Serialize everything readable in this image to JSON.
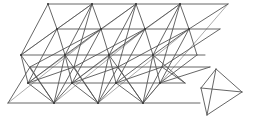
{
  "diagram": {
    "title": "",
    "stroke_color": "#555555",
    "light_stroke_color": "#888888",
    "background": "#ffffff",
    "lattice": {
      "rows": {
        "r0": {
          "y": 4,
          "xs": [
            48,
            92,
            136,
            180
          ]
        },
        "r1": {
          "y": 29,
          "xs": [
            57,
            101,
            145,
            189
          ]
        },
        "r2": {
          "y": 55,
          "xs": [
            21,
            65,
            109,
            153
          ]
        },
        "r3": {
          "y": 67,
          "xs": [
            30,
            74,
            118,
            162
          ]
        },
        "r4": {
          "y": 83,
          "xs": [
            28,
            72,
            116,
            160
          ]
        },
        "r5": {
          "y": 103,
          "xs": [
            54,
            98,
            143
          ]
        }
      },
      "lines": [
        [
          48,
          4,
          228,
          4
        ],
        [
          57,
          29,
          220,
          29
        ],
        [
          21,
          55,
          205,
          55
        ],
        [
          30,
          67,
          210,
          67
        ],
        [
          28,
          83,
          185,
          83
        ],
        [
          8,
          103,
          200,
          103
        ],
        [
          48,
          4,
          57,
          29
        ],
        [
          92,
          4,
          101,
          29
        ],
        [
          136,
          4,
          145,
          29
        ],
        [
          180,
          4,
          189,
          29
        ],
        [
          48,
          4,
          21,
          55
        ],
        [
          92,
          4,
          65,
          55
        ],
        [
          136,
          4,
          109,
          55
        ],
        [
          180,
          4,
          153,
          55
        ],
        [
          92,
          4,
          57,
          29
        ],
        [
          136,
          4,
          101,
          29
        ],
        [
          180,
          4,
          145,
          29
        ],
        [
          228,
          4,
          189,
          29
        ],
        [
          57,
          29,
          65,
          55
        ],
        [
          101,
          29,
          109,
          55
        ],
        [
          145,
          29,
          153,
          55
        ],
        [
          189,
          29,
          197,
          55
        ],
        [
          57,
          29,
          21,
          55
        ],
        [
          101,
          29,
          65,
          55
        ],
        [
          145,
          29,
          109,
          55
        ],
        [
          189,
          29,
          153,
          55
        ],
        [
          57,
          29,
          28,
          83
        ],
        [
          101,
          29,
          72,
          83
        ],
        [
          145,
          29,
          116,
          83
        ],
        [
          189,
          29,
          160,
          83
        ],
        [
          92,
          4,
          74,
          67
        ],
        [
          136,
          4,
          118,
          67
        ],
        [
          180,
          4,
          162,
          67
        ],
        [
          101,
          29,
          30,
          67
        ],
        [
          145,
          29,
          74,
          67
        ],
        [
          189,
          29,
          118,
          67
        ],
        [
          220,
          29,
          162,
          67
        ],
        [
          21,
          55,
          28,
          83
        ],
        [
          65,
          55,
          72,
          83
        ],
        [
          109,
          55,
          116,
          83
        ],
        [
          153,
          55,
          160,
          83
        ],
        [
          21,
          55,
          54,
          103
        ],
        [
          65,
          55,
          98,
          103
        ],
        [
          109,
          55,
          143,
          103
        ],
        [
          153,
          55,
          185,
          83
        ],
        [
          65,
          55,
          28,
          83
        ],
        [
          109,
          55,
          72,
          83
        ],
        [
          153,
          55,
          116,
          83
        ],
        [
          197,
          55,
          160,
          83
        ],
        [
          30,
          67,
          54,
          103
        ],
        [
          74,
          67,
          98,
          103
        ],
        [
          118,
          67,
          143,
          103
        ],
        [
          162,
          67,
          185,
          83
        ],
        [
          74,
          67,
          28,
          83
        ],
        [
          118,
          67,
          72,
          83
        ],
        [
          162,
          67,
          116,
          83
        ],
        [
          210,
          67,
          160,
          83
        ],
        [
          28,
          83,
          54,
          103
        ],
        [
          72,
          83,
          98,
          103
        ],
        [
          116,
          83,
          143,
          103
        ],
        [
          72,
          83,
          54,
          103
        ],
        [
          116,
          83,
          98,
          103
        ],
        [
          160,
          83,
          143,
          103
        ],
        [
          65,
          55,
          54,
          103
        ],
        [
          109,
          55,
          98,
          103
        ],
        [
          153,
          55,
          143,
          103
        ],
        [
          30,
          67,
          8,
          103
        ],
        [
          74,
          67,
          54,
          103
        ],
        [
          118,
          67,
          98,
          103
        ],
        [
          162,
          67,
          143,
          103
        ]
      ],
      "light_lines": [
        [
          8,
          103,
          101,
          29
        ],
        [
          54,
          103,
          145,
          29
        ],
        [
          98,
          103,
          189,
          29
        ],
        [
          143,
          103,
          228,
          4
        ],
        [
          28,
          83,
          136,
          4
        ],
        [
          72,
          83,
          180,
          4
        ],
        [
          21,
          55,
          92,
          4
        ]
      ],
      "nodes": [
        [
          48,
          4
        ],
        [
          92,
          4
        ],
        [
          136,
          4
        ],
        [
          180,
          4
        ],
        [
          57,
          29
        ],
        [
          101,
          29
        ],
        [
          145,
          29
        ],
        [
          189,
          29
        ],
        [
          21,
          55
        ],
        [
          65,
          55
        ],
        [
          109,
          55
        ],
        [
          153,
          55
        ],
        [
          28,
          83
        ],
        [
          72,
          83
        ],
        [
          116,
          83
        ],
        [
          160,
          83
        ],
        [
          54,
          103
        ],
        [
          98,
          103
        ],
        [
          143,
          103
        ]
      ]
    },
    "tetrahedron": {
      "vertices": {
        "top": [
          216,
          69
        ],
        "right": [
          242,
          92
        ],
        "left": [
          201,
          88
        ],
        "bottom": [
          207,
          115
        ]
      },
      "lines": [
        [
          216,
          69,
          242,
          92
        ],
        [
          216,
          69,
          201,
          88
        ],
        [
          201,
          88,
          207,
          115
        ],
        [
          207,
          115,
          242,
          92
        ],
        [
          201,
          88,
          242,
          92
        ],
        [
          216,
          69,
          207,
          115
        ]
      ]
    }
  }
}
